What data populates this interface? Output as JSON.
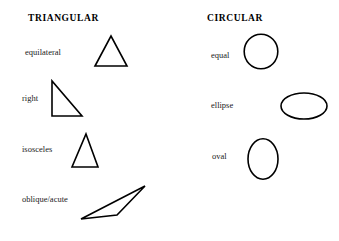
{
  "page": {
    "width": 339,
    "height": 241,
    "background_color": "#ffffff",
    "ink_color": "#000000",
    "title_text": "Shape classification diagram"
  },
  "columns": [
    {
      "id": "triangular",
      "heading": "TRIANGULAR",
      "heading_pos": {
        "x": 28,
        "y": 13
      },
      "rows": [
        {
          "label": "equilateral",
          "label_pos": {
            "x": 25,
            "y": 47
          },
          "shape_name": "equilateral-triangle",
          "shape_type": "polygon",
          "points": "15,32 30,1 45,32",
          "box": {
            "x": 94,
            "y": 34,
            "w": 34,
            "h": 34
          }
        },
        {
          "label": "right",
          "label_pos": {
            "x": 22,
            "y": 93
          },
          "shape_name": "right-triangle",
          "shape_type": "polygon",
          "points": "1,1 1,35 31,35",
          "box": {
            "x": 51,
            "y": 80,
            "w": 34,
            "h": 38
          }
        },
        {
          "label": "isosceles",
          "label_pos": {
            "x": 22,
            "y": 144
          },
          "shape_name": "isosceles-triangle",
          "shape_type": "polygon",
          "points": "14,1 27,33 1,33",
          "box": {
            "x": 70,
            "y": 133,
            "w": 30,
            "h": 36
          }
        },
        {
          "label": "oblique/acute",
          "label_pos": {
            "x": 22,
            "y": 194
          },
          "shape_name": "oblique-acute-triangle",
          "shape_type": "polygon",
          "points": "65,1 1,34 36,30",
          "box": {
            "x": 79,
            "y": 184,
            "w": 68,
            "h": 37
          }
        }
      ]
    },
    {
      "id": "circular",
      "heading": "CIRCULAR",
      "heading_pos": {
        "x": 37,
        "y": 13
      },
      "rows": [
        {
          "label": "equal",
          "label_pos": {
            "x": 41,
            "y": 50
          },
          "shape_name": "circle-equal",
          "shape_type": "ellipse",
          "ellipse": {
            "cx": 18,
            "cy": 18,
            "rx": 17,
            "ry": 17.5
          },
          "box": {
            "x": 243,
            "y": 33,
            "w": 36,
            "h": 37
          }
        },
        {
          "label": "ellipse",
          "label_pos": {
            "x": 41,
            "y": 100
          },
          "shape_name": "ellipse-wide",
          "shape_type": "ellipse",
          "ellipse": {
            "cx": 24,
            "cy": 14,
            "rx": 23,
            "ry": 13.5
          },
          "box": {
            "x": 280,
            "y": 92,
            "w": 48,
            "h": 28
          }
        },
        {
          "label": "oval",
          "label_pos": {
            "x": 42,
            "y": 151
          },
          "shape_name": "oval-tall",
          "shape_type": "ellipse",
          "ellipse": {
            "cx": 16,
            "cy": 21,
            "rx": 15,
            "ry": 20.5
          },
          "box": {
            "x": 247,
            "y": 138,
            "w": 32,
            "h": 42
          }
        }
      ]
    }
  ]
}
